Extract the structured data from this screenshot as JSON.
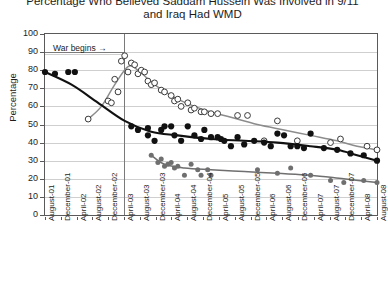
{
  "title": {
    "line1": "Percentage Who Believed Saddam Hussein Was Involved in 9/11",
    "line2": "and Iraq Had WMD"
  },
  "axes": {
    "ylabel": "Percentage",
    "yticks": [
      "100",
      "90",
      "80",
      "70",
      "60",
      "50",
      "40",
      "30",
      "20",
      "10",
      "0"
    ],
    "xticks": [
      "August-01",
      "December-01",
      "April-02",
      "August-02",
      "December-02",
      "April-03",
      "August-03",
      "December-03",
      "April-04",
      "August-04",
      "December-04",
      "April-05",
      "August-05",
      "December-05",
      "April-06",
      "August-06",
      "December-06",
      "April-07",
      "August-07",
      "December-07",
      "April-08",
      "August-08"
    ]
  },
  "annotation": {
    "war_label": "War begins",
    "war_arrow": "→",
    "war_x_label": "April-03"
  },
  "colors": {
    "black_series": "#111111",
    "gray_series": "#8c8c8c",
    "dark_gray_series": "#6f6f6f",
    "grid": "#cfcfcf",
    "frame": "#5a5a5a"
  },
  "chart_data": {
    "type": "scatter",
    "title": "Percentage Who Believed Saddam Hussein Was Involved in 9/11 and Iraq Had WMD",
    "xlabel": "",
    "ylabel": "Percentage",
    "ylim": [
      0,
      100
    ],
    "xlim": [
      "August-01",
      "August-08"
    ],
    "grid": true,
    "legend": "none",
    "annotations": [
      {
        "text": "War begins",
        "x": "April-03",
        "type": "vertical-line-with-arrow"
      }
    ],
    "series": [
      {
        "name": "Saddam involved in 9/11 (black filled circles, black trend line)",
        "marker": "filled-circle",
        "color": "#111111",
        "points": [
          {
            "x": 0.0,
            "y": 79
          },
          {
            "x": 0.03,
            "y": 78
          },
          {
            "x": 0.07,
            "y": 79
          },
          {
            "x": 0.09,
            "y": 79
          },
          {
            "x": 0.26,
            "y": 49
          },
          {
            "x": 0.28,
            "y": 47
          },
          {
            "x": 0.31,
            "y": 48
          },
          {
            "x": 0.31,
            "y": 44
          },
          {
            "x": 0.33,
            "y": 41
          },
          {
            "x": 0.35,
            "y": 47
          },
          {
            "x": 0.36,
            "y": 49
          },
          {
            "x": 0.38,
            "y": 49
          },
          {
            "x": 0.39,
            "y": 44
          },
          {
            "x": 0.41,
            "y": 41
          },
          {
            "x": 0.43,
            "y": 49
          },
          {
            "x": 0.45,
            "y": 44
          },
          {
            "x": 0.47,
            "y": 42
          },
          {
            "x": 0.48,
            "y": 47
          },
          {
            "x": 0.5,
            "y": 43
          },
          {
            "x": 0.52,
            "y": 43
          },
          {
            "x": 0.53,
            "y": 42
          },
          {
            "x": 0.54,
            "y": 41
          },
          {
            "x": 0.56,
            "y": 38
          },
          {
            "x": 0.58,
            "y": 43
          },
          {
            "x": 0.6,
            "y": 39
          },
          {
            "x": 0.63,
            "y": 41
          },
          {
            "x": 0.66,
            "y": 40
          },
          {
            "x": 0.68,
            "y": 38
          },
          {
            "x": 0.7,
            "y": 45
          },
          {
            "x": 0.72,
            "y": 44
          },
          {
            "x": 0.74,
            "y": 38
          },
          {
            "x": 0.76,
            "y": 38
          },
          {
            "x": 0.78,
            "y": 37
          },
          {
            "x": 0.8,
            "y": 45
          },
          {
            "x": 0.84,
            "y": 37
          },
          {
            "x": 0.88,
            "y": 36
          },
          {
            "x": 0.92,
            "y": 34
          },
          {
            "x": 0.96,
            "y": 33
          },
          {
            "x": 1.0,
            "y": 30
          }
        ],
        "trend": [
          {
            "x": 0.0,
            "y": 79
          },
          {
            "x": 0.08,
            "y": 72
          },
          {
            "x": 0.16,
            "y": 62
          },
          {
            "x": 0.24,
            "y": 52
          },
          {
            "x": 0.32,
            "y": 46
          },
          {
            "x": 0.4,
            "y": 44
          },
          {
            "x": 0.5,
            "y": 42
          },
          {
            "x": 0.6,
            "y": 41
          },
          {
            "x": 0.7,
            "y": 40
          },
          {
            "x": 0.8,
            "y": 38
          },
          {
            "x": 0.88,
            "y": 36
          },
          {
            "x": 0.94,
            "y": 33
          },
          {
            "x": 1.0,
            "y": 30
          }
        ]
      },
      {
        "name": "Iraq had WMD (open circles, gray trend line)",
        "marker": "open-circle",
        "color": "#8c8c8c",
        "points": [
          {
            "x": 0.13,
            "y": 53
          },
          {
            "x": 0.19,
            "y": 63
          },
          {
            "x": 0.2,
            "y": 62
          },
          {
            "x": 0.21,
            "y": 75
          },
          {
            "x": 0.22,
            "y": 68
          },
          {
            "x": 0.23,
            "y": 85
          },
          {
            "x": 0.24,
            "y": 88
          },
          {
            "x": 0.25,
            "y": 79
          },
          {
            "x": 0.26,
            "y": 84
          },
          {
            "x": 0.27,
            "y": 83
          },
          {
            "x": 0.28,
            "y": 78
          },
          {
            "x": 0.29,
            "y": 80
          },
          {
            "x": 0.3,
            "y": 79
          },
          {
            "x": 0.31,
            "y": 74
          },
          {
            "x": 0.32,
            "y": 72
          },
          {
            "x": 0.33,
            "y": 73
          },
          {
            "x": 0.35,
            "y": 69
          },
          {
            "x": 0.36,
            "y": 68
          },
          {
            "x": 0.38,
            "y": 66
          },
          {
            "x": 0.39,
            "y": 63
          },
          {
            "x": 0.4,
            "y": 64
          },
          {
            "x": 0.41,
            "y": 60
          },
          {
            "x": 0.43,
            "y": 62
          },
          {
            "x": 0.44,
            "y": 58
          },
          {
            "x": 0.45,
            "y": 59
          },
          {
            "x": 0.47,
            "y": 57
          },
          {
            "x": 0.48,
            "y": 57
          },
          {
            "x": 0.5,
            "y": 56
          },
          {
            "x": 0.52,
            "y": 56
          },
          {
            "x": 0.58,
            "y": 55
          },
          {
            "x": 0.61,
            "y": 55
          },
          {
            "x": 0.66,
            "y": 41
          },
          {
            "x": 0.7,
            "y": 52
          },
          {
            "x": 0.76,
            "y": 41
          },
          {
            "x": 0.86,
            "y": 40
          },
          {
            "x": 0.89,
            "y": 42
          },
          {
            "x": 0.97,
            "y": 38
          },
          {
            "x": 1.0,
            "y": 36
          }
        ],
        "trend": [
          {
            "x": 0.13,
            "y": 53
          },
          {
            "x": 0.17,
            "y": 60
          },
          {
            "x": 0.21,
            "y": 72
          },
          {
            "x": 0.25,
            "y": 82
          },
          {
            "x": 0.28,
            "y": 80
          },
          {
            "x": 0.33,
            "y": 72
          },
          {
            "x": 0.4,
            "y": 64
          },
          {
            "x": 0.48,
            "y": 58
          },
          {
            "x": 0.56,
            "y": 54
          },
          {
            "x": 0.64,
            "y": 50
          },
          {
            "x": 0.72,
            "y": 47
          },
          {
            "x": 0.8,
            "y": 44
          },
          {
            "x": 0.88,
            "y": 41
          },
          {
            "x": 0.94,
            "y": 38
          },
          {
            "x": 1.0,
            "y": 36
          }
        ]
      },
      {
        "name": "Third series (small gray filled circles, gray trend line)",
        "marker": "small-filled-circle",
        "color": "#6f6f6f",
        "points": [
          {
            "x": 0.32,
            "y": 33
          },
          {
            "x": 0.34,
            "y": 29
          },
          {
            "x": 0.35,
            "y": 31
          },
          {
            "x": 0.36,
            "y": 27
          },
          {
            "x": 0.37,
            "y": 28
          },
          {
            "x": 0.38,
            "y": 29
          },
          {
            "x": 0.39,
            "y": 26
          },
          {
            "x": 0.4,
            "y": 27
          },
          {
            "x": 0.42,
            "y": 22
          },
          {
            "x": 0.44,
            "y": 28
          },
          {
            "x": 0.46,
            "y": 25
          },
          {
            "x": 0.47,
            "y": 22
          },
          {
            "x": 0.49,
            "y": 25
          },
          {
            "x": 0.5,
            "y": 22
          },
          {
            "x": 0.64,
            "y": 25
          },
          {
            "x": 0.7,
            "y": 23
          },
          {
            "x": 0.74,
            "y": 26
          },
          {
            "x": 0.8,
            "y": 22
          },
          {
            "x": 0.86,
            "y": 19
          },
          {
            "x": 0.9,
            "y": 18
          },
          {
            "x": 0.96,
            "y": 19
          },
          {
            "x": 1.0,
            "y": 18
          }
        ],
        "trend": [
          {
            "x": 0.32,
            "y": 33
          },
          {
            "x": 0.36,
            "y": 28
          },
          {
            "x": 0.42,
            "y": 26
          },
          {
            "x": 0.5,
            "y": 25
          },
          {
            "x": 0.6,
            "y": 24
          },
          {
            "x": 0.7,
            "y": 23
          },
          {
            "x": 0.8,
            "y": 22
          },
          {
            "x": 0.9,
            "y": 20
          },
          {
            "x": 1.0,
            "y": 18
          }
        ]
      }
    ]
  }
}
